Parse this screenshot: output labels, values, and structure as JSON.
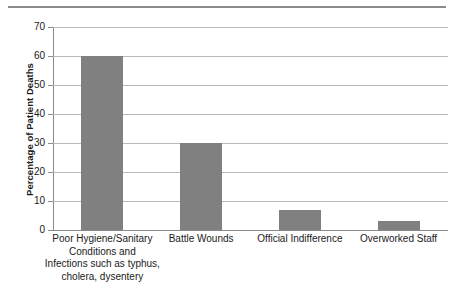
{
  "chart_data": {
    "type": "bar",
    "title": "",
    "subtitle": "",
    "xlabel": "",
    "ylabel": "Percentage of Patient Deaths",
    "ylim": [
      0,
      70
    ],
    "ytick_values": [
      0,
      10,
      20,
      30,
      40,
      50,
      60,
      70
    ],
    "ytick_labels": [
      "0",
      "10",
      "20",
      "30",
      "40",
      "50",
      "60",
      "70"
    ],
    "grid": "horizontal",
    "legend": "none",
    "bar_color": "#808080",
    "gridline_color": "#b8b8b8",
    "axis_color": "#8a8a8a",
    "categories": [
      "Poor Hygiene/Sanitary Conditions and Infections such as typhus, cholera, dysentery",
      "Battle Wounds",
      "Official Indifference",
      "Overworked Staff"
    ],
    "category_label_lines": [
      [
        "Poor Hygiene/Sanitary",
        "Conditions and",
        "Infections such as typhus,",
        "cholera, dysentery"
      ],
      [
        "Battle Wounds"
      ],
      [
        "Official Indifference"
      ],
      [
        "Overworked Staff"
      ]
    ],
    "values": [
      60,
      30,
      7,
      3
    ],
    "annotations": []
  },
  "decor": {
    "top_rule": "horizontal-rule"
  }
}
